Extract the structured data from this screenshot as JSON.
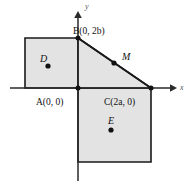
{
  "figure": {
    "kind": "coordinate-geometry-diagram",
    "width": 189,
    "height": 189,
    "background_color": "#ffffff",
    "shading_color": "#e3e3e3",
    "outline_color": "#1a1a1a",
    "axis_color": "#2a2a2a"
  },
  "axes": {
    "x_label": "x",
    "y_label": "y",
    "origin_px": [
      78,
      88
    ]
  },
  "vertex_labels": {
    "A": "A(0, 0)",
    "B": "B(0, 2b)",
    "C": "C(2a, 0)",
    "D": "D",
    "E": "E",
    "M": "M"
  },
  "points": [
    {
      "name": "A",
      "label": "A(0, 0)",
      "coords": "(0, 0)",
      "px": [
        78,
        88
      ],
      "dot": false
    },
    {
      "name": "B",
      "label": "B(0, 2b)",
      "coords": "(0, 2b)",
      "px": [
        78,
        38
      ],
      "dot": false
    },
    {
      "name": "C",
      "label": "C(2a, 0)",
      "coords": "(2a, 0)",
      "px": [
        151,
        88
      ],
      "dot": false
    },
    {
      "name": "D",
      "label": "D",
      "coords": "",
      "px": [
        48,
        66
      ],
      "dot": true
    },
    {
      "name": "E",
      "label": "E",
      "coords": "",
      "px": [
        111,
        130
      ],
      "dot": true
    },
    {
      "name": "M",
      "label": "M",
      "coords": "",
      "px": [
        114,
        63
      ],
      "dot": true
    }
  ],
  "shapes": [
    {
      "name": "square-on-AB",
      "role": "left square",
      "fill": "#e3e3e3"
    },
    {
      "name": "triangle-ABC",
      "role": "right triangle",
      "fill": "#e3e3e3"
    },
    {
      "name": "square-on-AC",
      "role": "bottom square",
      "fill": "#e3e3e3"
    }
  ]
}
